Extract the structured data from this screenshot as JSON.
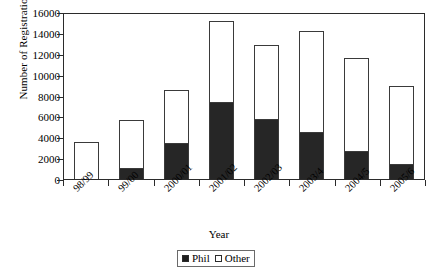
{
  "chart_data": {
    "type": "bar",
    "subtype": "stacked",
    "title": "",
    "xlabel": "Year",
    "ylabel": "Number of Registrations",
    "categories": [
      "98/99",
      "99/00",
      "2000/01",
      "2001/02",
      "2002/03",
      "2003/4",
      "2004/5",
      "2005/6"
    ],
    "series": [
      {
        "name": "Phil",
        "values": [
          0,
          1100,
          3450,
          7400,
          5800,
          4500,
          2700,
          1500
        ]
      },
      {
        "name": "Other",
        "values": [
          3500,
          4600,
          5050,
          7700,
          7000,
          9700,
          8900,
          7400
        ]
      }
    ],
    "totals": [
      3500,
      5700,
      8500,
      15100,
      12800,
      14200,
      11600,
      8900
    ],
    "ylim": [
      0,
      16000
    ],
    "ytick_step": 2000,
    "yticks": [
      "0",
      "2000",
      "4000",
      "6000",
      "8000",
      "10000",
      "12000",
      "14000",
      "16000"
    ],
    "grid": false,
    "legend_position": "bottom-center",
    "colors": {
      "phil": "#262626",
      "other": "#ffffff",
      "axis": "#2b2b2b",
      "bar_border": "#3a3a3a"
    }
  },
  "legend": {
    "entries": [
      {
        "label": "Phil",
        "swatch": "filled-square-icon"
      },
      {
        "label": "Other",
        "swatch": "empty-square-icon"
      }
    ]
  }
}
